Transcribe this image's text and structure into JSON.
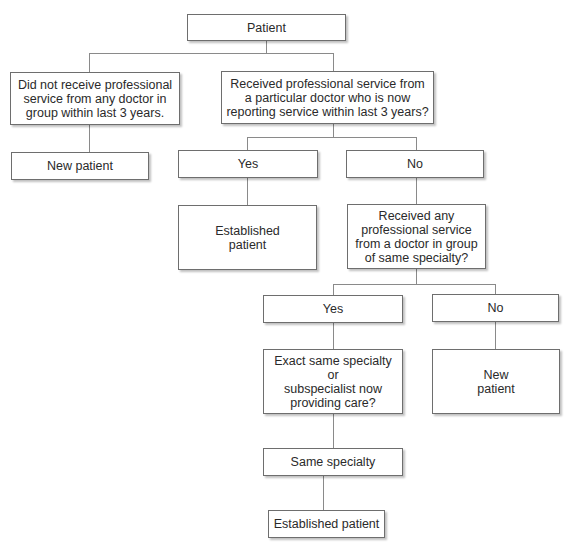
{
  "diagram": {
    "type": "flowchart",
    "nodes": {
      "root": {
        "label": "Patient"
      },
      "no_service": {
        "label": "Did not receive professional\nservice from any doctor in\ngroup within last 3 years."
      },
      "received_particular": {
        "label": "Received professional service from\na particular doctor who is now\nreporting service within last 3 years?"
      },
      "new_patient_1": {
        "label": "New patient"
      },
      "yes_1": {
        "label": "Yes"
      },
      "no_1": {
        "label": "No"
      },
      "established_1": {
        "label": "Established\npatient"
      },
      "received_any": {
        "label": "Received any\nprofessional service\nfrom a doctor in group\nof same specialty?"
      },
      "yes_2": {
        "label": "Yes"
      },
      "no_2": {
        "label": "No"
      },
      "exact_same": {
        "label": "Exact same specialty or\nsubspecialist now\nproviding care?"
      },
      "new_patient_2": {
        "label": "New\npatient"
      },
      "same_specialty": {
        "label": "Same specialty"
      },
      "established_2": {
        "label": "Established patient"
      }
    },
    "edges": [
      [
        "root",
        "no_service"
      ],
      [
        "root",
        "received_particular"
      ],
      [
        "no_service",
        "new_patient_1"
      ],
      [
        "received_particular",
        "yes_1"
      ],
      [
        "received_particular",
        "no_1"
      ],
      [
        "yes_1",
        "established_1"
      ],
      [
        "no_1",
        "received_any"
      ],
      [
        "received_any",
        "yes_2"
      ],
      [
        "received_any",
        "no_2"
      ],
      [
        "yes_2",
        "exact_same"
      ],
      [
        "no_2",
        "new_patient_2"
      ],
      [
        "exact_same",
        "same_specialty"
      ],
      [
        "same_specialty",
        "established_2"
      ]
    ],
    "colors": {
      "border": "#6e6e6e",
      "connector": "#8a8a8a",
      "text": "#2a2a2a",
      "background": "#ffffff"
    }
  }
}
